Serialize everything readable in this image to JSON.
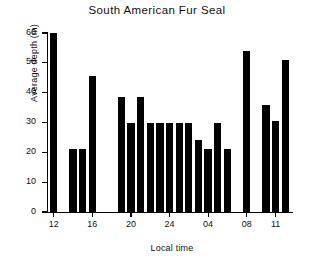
{
  "chart_data": {
    "type": "bar",
    "title": "South American Fur Seal",
    "xlabel": "Local time",
    "ylabel": "Average depth (m)",
    "ylim": [
      0,
      60
    ],
    "yticks": [
      0,
      10,
      20,
      30,
      40,
      50,
      60
    ],
    "ytick_labels": [
      "0",
      "10",
      "20",
      "30",
      "40",
      "50",
      "60"
    ],
    "xticks": [
      12,
      16,
      20,
      24,
      28,
      32,
      35
    ],
    "xtick_labels": [
      "12",
      "16",
      "20",
      "24",
      "04",
      "08",
      "11"
    ],
    "grid": false,
    "legend": null,
    "bar_color": "#000000",
    "categories": [
      "12",
      "13",
      "14",
      "15",
      "16",
      "17",
      "18",
      "19",
      "20",
      "21",
      "22",
      "23",
      "24",
      "01",
      "02",
      "03",
      "04",
      "05",
      "06",
      "07",
      "08",
      "09",
      "10",
      "11",
      "12"
    ],
    "values": [
      60,
      null,
      21,
      21,
      45.5,
      null,
      null,
      38.5,
      30,
      38.5,
      30,
      30,
      30,
      30,
      30,
      24,
      21,
      30,
      21,
      null,
      54,
      null,
      36,
      30.5,
      51
    ],
    "bars": [
      {
        "hour": "12",
        "x": 12,
        "value": 60
      },
      {
        "hour": "14",
        "x": 14,
        "value": 21
      },
      {
        "hour": "15",
        "x": 15,
        "value": 21
      },
      {
        "hour": "16",
        "x": 16,
        "value": 45.5
      },
      {
        "hour": "19",
        "x": 19,
        "value": 38.5
      },
      {
        "hour": "20",
        "x": 20,
        "value": 30
      },
      {
        "hour": "21",
        "x": 21,
        "value": 38.5
      },
      {
        "hour": "22",
        "x": 22,
        "value": 30
      },
      {
        "hour": "23",
        "x": 23,
        "value": 30
      },
      {
        "hour": "24",
        "x": 24,
        "value": 30
      },
      {
        "hour": "01",
        "x": 25,
        "value": 30
      },
      {
        "hour": "02",
        "x": 26,
        "value": 30
      },
      {
        "hour": "03",
        "x": 27,
        "value": 24
      },
      {
        "hour": "04",
        "x": 28,
        "value": 21
      },
      {
        "hour": "05",
        "x": 29,
        "value": 30
      },
      {
        "hour": "06",
        "x": 30,
        "value": 21
      },
      {
        "hour": "08",
        "x": 32,
        "value": 54
      },
      {
        "hour": "10",
        "x": 34,
        "value": 36
      },
      {
        "hour": "11",
        "x": 35,
        "value": 30.5
      },
      {
        "hour": "12b",
        "x": 36,
        "value": 51
      }
    ],
    "xrange": [
      11.4,
      36.8
    ]
  }
}
